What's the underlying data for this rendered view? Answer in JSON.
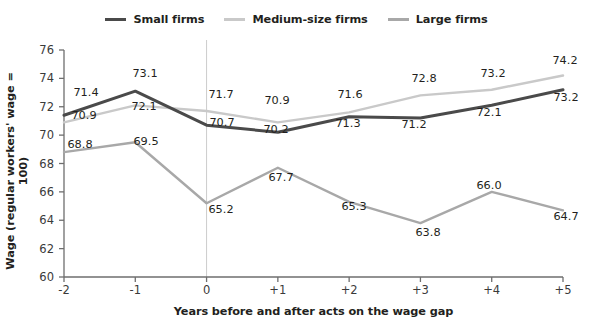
{
  "chart_data": {
    "type": "line",
    "title": "",
    "xlabel": "Years before and after acts on the wage gap",
    "ylabel": "Wage (regular workers' wage = 100)",
    "categories": [
      "-2",
      "-1",
      "0",
      "+1",
      "+2",
      "+3",
      "+4",
      "+5"
    ],
    "x_tick_labels": [
      "-2",
      "-1",
      "0",
      "+1",
      "+2",
      "+3",
      "+4",
      "+5"
    ],
    "y_tick_labels": [
      "60",
      "62",
      "64",
      "66",
      "68",
      "70",
      "72",
      "74",
      "76"
    ],
    "y_ticks": [
      60,
      62,
      64,
      66,
      68,
      70,
      72,
      74,
      76
    ],
    "ylim": [
      60,
      76
    ],
    "grid": false,
    "reference_line_x": "0",
    "legend_position": "top-center",
    "series": [
      {
        "name": "Small firms",
        "color": "#4a4a4a",
        "values": [
          71.4,
          73.1,
          70.7,
          70.2,
          71.3,
          71.2,
          72.1,
          73.2
        ],
        "labels": [
          "71.4",
          "73.1",
          "70.7",
          "70.2",
          "71.3",
          "71.2",
          "72.1",
          "73.2"
        ]
      },
      {
        "name": "Medium-size firms",
        "color": "#c9c9c9",
        "values": [
          70.9,
          72.1,
          71.7,
          70.9,
          71.6,
          72.8,
          73.2,
          74.2
        ],
        "labels": [
          "70.9",
          "72.1",
          "71.7",
          "70.9",
          "71.6",
          "72.8",
          "73.2",
          "74.2"
        ]
      },
      {
        "name": "Large firms",
        "color": "#a8a8a8",
        "values": [
          68.8,
          69.5,
          65.2,
          67.7,
          65.3,
          63.8,
          66.0,
          64.7
        ],
        "labels": [
          "68.8",
          "69.5",
          "65.2",
          "67.7",
          "65.3",
          "63.8",
          "66.0",
          "64.7"
        ]
      }
    ]
  },
  "legend": {
    "items": [
      {
        "label": "Small firms",
        "color": "#4a4a4a"
      },
      {
        "label": "Medium-size firms",
        "color": "#c9c9c9"
      },
      {
        "label": "Large firms",
        "color": "#a8a8a8"
      }
    ]
  },
  "axes": {
    "x_title": "Years before and after acts on the wage gap",
    "y_title": "Wage (regular workers' wage = 100)"
  },
  "colors": {
    "small_firms": "#4a4a4a",
    "medium_firms": "#c9c9c9",
    "large_firms": "#a8a8a8",
    "axis": "#6e6e6e",
    "text": "#231f20",
    "background": "#ffffff"
  },
  "point_labels": [
    {
      "text": "71.4",
      "x": 86,
      "y": 92
    },
    {
      "text": "73.1",
      "x": 145,
      "y": 73
    },
    {
      "text": "70.7",
      "x": 222,
      "y": 122
    },
    {
      "text": "70.2",
      "x": 276,
      "y": 129
    },
    {
      "text": "71.3",
      "x": 348,
      "y": 123
    },
    {
      "text": "71.2",
      "x": 414,
      "y": 124
    },
    {
      "text": "72.1",
      "x": 489,
      "y": 112
    },
    {
      "text": "73.2",
      "x": 566,
      "y": 97
    },
    {
      "text": "70.9",
      "x": 84,
      "y": 115
    },
    {
      "text": "72.1",
      "x": 144,
      "y": 106
    },
    {
      "text": "71.7",
      "x": 221,
      "y": 94
    },
    {
      "text": "70.9",
      "x": 277,
      "y": 100
    },
    {
      "text": "71.6",
      "x": 350,
      "y": 94
    },
    {
      "text": "72.8",
      "x": 424,
      "y": 78
    },
    {
      "text": "73.2",
      "x": 493,
      "y": 73
    },
    {
      "text": "74.2",
      "x": 565,
      "y": 60
    },
    {
      "text": "68.8",
      "x": 80,
      "y": 144
    },
    {
      "text": "69.5",
      "x": 146,
      "y": 141
    },
    {
      "text": "65.2",
      "x": 221,
      "y": 209
    },
    {
      "text": "67.7",
      "x": 281,
      "y": 177
    },
    {
      "text": "65.3",
      "x": 354,
      "y": 206
    },
    {
      "text": "63.8",
      "x": 428,
      "y": 232
    },
    {
      "text": "66.0",
      "x": 489,
      "y": 185
    },
    {
      "text": "64.7",
      "x": 566,
      "y": 216
    }
  ]
}
